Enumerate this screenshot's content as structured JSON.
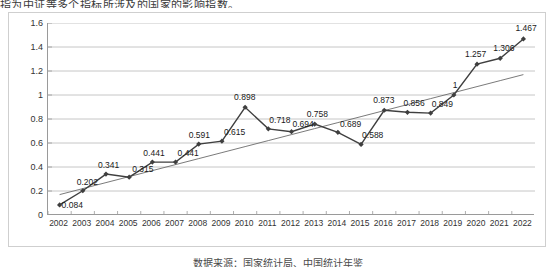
{
  "top_caption": "指为中证等多个指标所涉及的国家的影响指数。",
  "bottom_caption": "数据来源：国家统计局、中国统计年鉴",
  "colors": {
    "series_line": "#3f3f3f",
    "trend_line": "#6b6b6b",
    "gridline": "#b8b8b8",
    "axis": "#9a9a9a",
    "frame": "#cfcfcf",
    "text": "#1a1a1a"
  },
  "chart_data": {
    "type": "line",
    "title": "",
    "subtitle": "",
    "xlabel": "",
    "ylabel": "",
    "ylim": [
      0,
      1.6
    ],
    "yticks": [
      "0",
      "0.2",
      "0.4",
      "0.6",
      "0.8",
      "1",
      "1.2",
      "1.4",
      "1.6"
    ],
    "ytick_values": [
      0,
      0.2,
      0.4,
      0.6,
      0.8,
      1,
      1.2,
      1.4,
      1.6
    ],
    "grid": true,
    "legend": "none",
    "categories": [
      "2002",
      "2003",
      "2004",
      "2005",
      "2006",
      "2007",
      "2008",
      "2009",
      "2010",
      "2011",
      "2012",
      "2013",
      "2014",
      "2015",
      "2016",
      "2017",
      "2018",
      "2019",
      "2020",
      "2021",
      "2022"
    ],
    "series": [
      {
        "name": "指数值",
        "marker": "diamond",
        "values": [
          0.084,
          0.202,
          0.341,
          0.315,
          0.441,
          0.441,
          0.591,
          0.615,
          0.898,
          0.718,
          0.694,
          0.758,
          0.689,
          0.588,
          0.873,
          0.856,
          0.849,
          1,
          1.257,
          1.306,
          1.467
        ],
        "labels": [
          "0.084",
          "0.202",
          "0.341",
          "0.315",
          "0.441",
          "0.441",
          "0.591",
          "0.615",
          "0.898",
          "0.718",
          "0.694",
          "0.758",
          "0.689",
          "0.588",
          "0.873",
          "0.856",
          "0.849",
          "1",
          "1.257",
          "1.306",
          "1.467"
        ]
      },
      {
        "name": "线性 (趋势线)",
        "marker": "none",
        "trend": true,
        "values": [
          0.17,
          0.22,
          0.27,
          0.32,
          0.37,
          0.42,
          0.47,
          0.52,
          0.57,
          0.62,
          0.67,
          0.72,
          0.77,
          0.82,
          0.87,
          0.92,
          0.97,
          1.02,
          1.07,
          1.12,
          1.17
        ]
      }
    ],
    "label_offsets": [
      {
        "dx": 2,
        "dy": -4
      },
      {
        "dx": -6,
        "dy": -13
      },
      {
        "dx": -8,
        "dy": -13
      },
      {
        "dx": 3,
        "dy": -12
      },
      {
        "dx": -9,
        "dy": -13
      },
      {
        "dx": 2,
        "dy": -13
      },
      {
        "dx": -10,
        "dy": -13
      },
      {
        "dx": 2,
        "dy": -13
      },
      {
        "dx": -11,
        "dy": -14
      },
      {
        "dx": 1,
        "dy": -13
      },
      {
        "dx": 1,
        "dy": -12
      },
      {
        "dx": -8,
        "dy": -14
      },
      {
        "dx": 2,
        "dy": -12
      },
      {
        "dx": 1,
        "dy": -13
      },
      {
        "dx": -11,
        "dy": -14
      },
      {
        "dx": -4,
        "dy": -13
      },
      {
        "dx": 1,
        "dy": -13
      },
      {
        "dx": -1,
        "dy": -14
      },
      {
        "dx": -12,
        "dy": -14
      },
      {
        "dx": -7,
        "dy": -14
      },
      {
        "dx": -8,
        "dy": -15
      }
    ]
  }
}
